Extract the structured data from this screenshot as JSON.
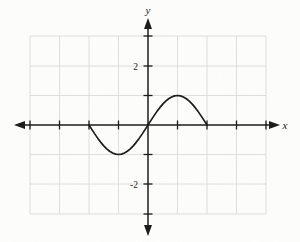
{
  "figure": {
    "name": "sine-curve-graph",
    "background_color": "#fdfdfc",
    "axis_color": "#1a1a1a",
    "grid_color": "#d9d6d2",
    "curve_color": "#1a1a1a"
  },
  "axes": {
    "x_axis_label": "x",
    "y_axis_label": "y",
    "x_tick_labels": [],
    "y_tick_labels": [
      "2",
      "-2"
    ],
    "y_tick_values": [
      2,
      -2
    ],
    "x_arrow_left": true,
    "x_arrow_right": true,
    "y_arrow_up": true,
    "y_arrow_down": true
  },
  "chart_data": {
    "type": "line",
    "title": "",
    "xlabel": "x",
    "ylabel": "y",
    "xlim": [
      -4.5,
      4.2
    ],
    "ylim": [
      -3.3,
      3.4
    ],
    "grid": true,
    "grid_x": [
      -4,
      -3,
      -2,
      -1,
      0,
      1,
      2,
      3,
      4
    ],
    "grid_y": [
      -3,
      -2,
      -1,
      0,
      1,
      2,
      3
    ],
    "x_ticks": [
      -4,
      -3,
      -2,
      -1,
      1,
      2,
      3,
      4
    ],
    "y_ticks": [
      -3,
      -2,
      -1,
      1,
      2,
      3
    ],
    "legend": null,
    "series": [
      {
        "name": "y = sin(pi*x/2)",
        "domain": [
          -2,
          2
        ],
        "amplitude": 1,
        "period": 4,
        "x": [
          -2.0,
          -1.9,
          -1.8,
          -1.7,
          -1.6,
          -1.5,
          -1.4,
          -1.3,
          -1.2,
          -1.1,
          -1.0,
          -0.9,
          -0.8,
          -0.7,
          -0.6,
          -0.5,
          -0.4,
          -0.3,
          -0.2,
          -0.1,
          0.0,
          0.1,
          0.2,
          0.3,
          0.4,
          0.5,
          0.6,
          0.7,
          0.8,
          0.9,
          1.0,
          1.1,
          1.2,
          1.3,
          1.4,
          1.5,
          1.6,
          1.7,
          1.8,
          1.9,
          2.0
        ],
        "y": [
          0.0,
          -0.156,
          -0.309,
          -0.454,
          -0.588,
          -0.707,
          -0.809,
          -0.891,
          -0.951,
          -0.988,
          -1.0,
          -0.988,
          -0.951,
          -0.891,
          -0.809,
          -0.707,
          -0.588,
          -0.454,
          -0.309,
          -0.156,
          0.0,
          0.156,
          0.309,
          0.454,
          0.588,
          0.707,
          0.809,
          0.891,
          0.951,
          0.988,
          1.0,
          0.988,
          0.951,
          0.891,
          0.809,
          0.707,
          0.588,
          0.454,
          0.309,
          0.156,
          0.0
        ]
      }
    ],
    "key_points": {
      "zeros": [
        -2,
        0,
        2
      ],
      "minimum": {
        "x": -1,
        "y": -1
      },
      "maximum": {
        "x": 1,
        "y": 1
      }
    }
  }
}
